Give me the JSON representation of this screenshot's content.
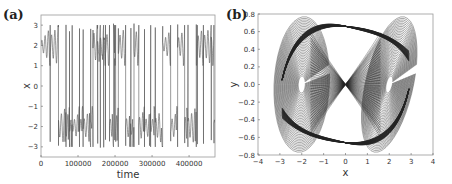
{
  "chart_data": [
    {
      "panel": "(a)",
      "type": "line",
      "title": "",
      "xlabel": "time",
      "ylabel": "x",
      "xlim": [
        0,
        470000
      ],
      "ylim": [
        -3.5,
        3.5
      ],
      "xticks": [
        0,
        100000,
        200000,
        300000,
        400000
      ],
      "xtick_labels": [
        "0",
        "100000",
        "200000",
        "300000",
        "400000"
      ],
      "yticks": [
        -3,
        -2,
        -1,
        0,
        1,
        2,
        3
      ],
      "ytick_labels": [
        "−3",
        "−2",
        "−1",
        "0",
        "1",
        "2",
        "3"
      ],
      "grid": false,
      "series": [
        {
          "name": "x(t)",
          "color": "#555555",
          "description": "Chaotic time series switching between oscillations around x≈+2 and x≈−2 with amplitude up to ±3",
          "x": [
            0,
            10000,
            20000,
            30000,
            45000,
            60000,
            75000,
            90000,
            105000,
            120000,
            135000,
            150000,
            165000,
            180000,
            195000,
            210000,
            225000,
            240000,
            255000,
            270000,
            285000,
            300000,
            315000,
            330000,
            345000,
            360000,
            375000,
            390000,
            405000,
            420000,
            435000,
            450000,
            465000
          ],
          "y": [
            2,
            -2,
            2.8,
            -2.5,
            2,
            -2,
            2.5,
            -2,
            2,
            -2.8,
            2,
            2,
            -2,
            2,
            -2,
            2,
            -2.5,
            2.5,
            -2,
            2,
            -2,
            2,
            -2,
            2.5,
            -2,
            2,
            -2,
            2.5,
            -2,
            2,
            -2,
            2,
            -2
          ]
        }
      ]
    },
    {
      "panel": "(b)",
      "type": "line",
      "title": "",
      "xlabel": "x",
      "ylabel": "y",
      "xlim": [
        -4,
        4
      ],
      "ylim": [
        -0.8,
        0.8
      ],
      "xticks": [
        -4,
        -3,
        -2,
        -1,
        0,
        1,
        2,
        3,
        4
      ],
      "xtick_labels": [
        "−4",
        "−3",
        "−2",
        "−1",
        "0",
        "1",
        "2",
        "3",
        "4"
      ],
      "yticks": [
        -0.8,
        -0.6,
        -0.4,
        -0.2,
        0.0,
        0.2,
        0.4,
        0.6,
        0.8
      ],
      "ytick_labels": [
        "−0.8",
        "−0.6",
        "−0.4",
        "−0.2",
        "0.0",
        "0.2",
        "0.4",
        "0.6",
        "0.8"
      ],
      "grid": false,
      "series": [
        {
          "name": "phase portrait (x, y)",
          "color": "#222222",
          "description": "Double-scroll chaotic attractor with two spiral lobes centered near (−2, 0) and (2, 0), bounded x∈[−3.1, 3.1], y∈[−0.7, 0.7]",
          "lobe_centers": [
            [
              -2,
              0
            ],
            [
              2,
              0
            ]
          ],
          "x_range": [
            -3.1,
            3.1
          ],
          "y_range": [
            -0.7,
            0.7
          ]
        }
      ]
    }
  ],
  "labels": {
    "panel_a": "(a)",
    "panel_b": "(b)"
  }
}
